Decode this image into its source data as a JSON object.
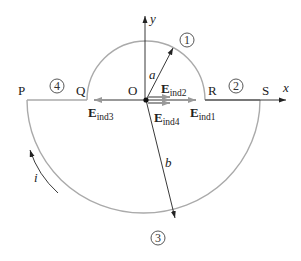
{
  "diagram": {
    "axes": {
      "x_label": "x",
      "y_label": "y"
    },
    "points": {
      "P": "P",
      "Q": "Q",
      "O": "O",
      "R": "R",
      "S": "S"
    },
    "radii": {
      "small": "a",
      "large": "b"
    },
    "current": {
      "label": "i"
    },
    "segments": {
      "s1": "1",
      "s2": "2",
      "s3": "3",
      "s4": "4"
    },
    "fields": {
      "e1": {
        "main": "E",
        "sub": "ind1"
      },
      "e2": {
        "main": "E",
        "sub": "ind2"
      },
      "e3": {
        "main": "E",
        "sub": "ind3"
      },
      "e4": {
        "main": "E",
        "sub": "ind4"
      }
    },
    "colors": {
      "wire": "#a9a9a9",
      "field_arrow": "#9a9a9a",
      "axis": "#222222",
      "radius": "#222222"
    }
  }
}
